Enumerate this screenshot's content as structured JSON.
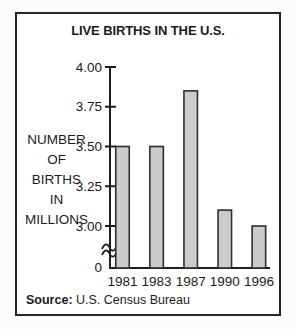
{
  "chart_data": {
    "type": "bar",
    "title": "LIVE BIRTHS IN THE U.S.",
    "categories": [
      "1981",
      "1983",
      "1987",
      "1990",
      "1996"
    ],
    "values": [
      3.5,
      3.5,
      3.85,
      3.1,
      3.0
    ],
    "ylabel_lines": [
      "NUMBER",
      "OF",
      "BIRTHS",
      "IN",
      "MILLIONS"
    ],
    "yticks": [
      {
        "value": 4.0,
        "label": "4.00"
      },
      {
        "value": 3.75,
        "label": "3.75"
      },
      {
        "value": 3.5,
        "label": "3.50"
      },
      {
        "value": 3.25,
        "label": "3.25"
      },
      {
        "value": 3.0,
        "label": "3.00"
      }
    ],
    "origin_label": "0",
    "axis_break": true,
    "ylim_visible": [
      3.0,
      4.0
    ],
    "grid": false,
    "legend": false,
    "xlabel": "",
    "ylabel": "NUMBER OF BIRTHS IN MILLIONS",
    "colors": {
      "bar_fill": "#cbcbcb",
      "bar_stroke": "#2e2e2e",
      "axis": "#1e1e1e",
      "frame_border": "#262626"
    },
    "source": {
      "label": "Source:",
      "text": "U.S. Census Bureau"
    }
  }
}
